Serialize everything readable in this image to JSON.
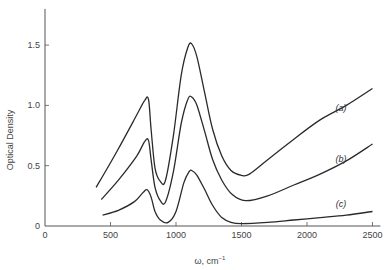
{
  "chart_data": {
    "type": "line",
    "title": "",
    "xlabel": "ω, cm⁻¹",
    "ylabel": "Optical Density",
    "xlim": [
      0,
      2500
    ],
    "ylim": [
      0,
      1.8
    ],
    "x_ticks": [
      0,
      500,
      1000,
      1500,
      2000,
      2500
    ],
    "y_ticks": [
      0,
      0.5,
      1.0,
      1.5
    ],
    "x_tick_labels": [
      "0",
      "500",
      "1000",
      "1500",
      "2000",
      "2500"
    ],
    "y_tick_labels": [
      "0",
      "0.5",
      "1.0",
      "1.5"
    ],
    "grid": false,
    "legend": "inline labels",
    "series": [
      {
        "name": "(a)",
        "label_pos": [
          2260,
          0.95
        ],
        "points": [
          [
            390,
            0.32
          ],
          [
            550,
            0.62
          ],
          [
            700,
            0.92
          ],
          [
            760,
            1.04
          ],
          [
            790,
            1.05
          ],
          [
            810,
            0.8
          ],
          [
            840,
            0.48
          ],
          [
            880,
            0.37
          ],
          [
            920,
            0.38
          ],
          [
            980,
            0.75
          ],
          [
            1040,
            1.25
          ],
          [
            1090,
            1.48
          ],
          [
            1120,
            1.51
          ],
          [
            1160,
            1.4
          ],
          [
            1220,
            1.1
          ],
          [
            1280,
            0.8
          ],
          [
            1350,
            0.58
          ],
          [
            1420,
            0.46
          ],
          [
            1500,
            0.42
          ],
          [
            1560,
            0.43
          ],
          [
            1700,
            0.55
          ],
          [
            1900,
            0.72
          ],
          [
            2100,
            0.88
          ],
          [
            2300,
            1.0
          ],
          [
            2500,
            1.14
          ]
        ]
      },
      {
        "name": "(b)",
        "label_pos": [
          2260,
          0.53
        ],
        "points": [
          [
            430,
            0.22
          ],
          [
            560,
            0.38
          ],
          [
            700,
            0.58
          ],
          [
            760,
            0.7
          ],
          [
            790,
            0.71
          ],
          [
            810,
            0.55
          ],
          [
            840,
            0.32
          ],
          [
            880,
            0.21
          ],
          [
            920,
            0.2
          ],
          [
            980,
            0.45
          ],
          [
            1040,
            0.85
          ],
          [
            1090,
            1.05
          ],
          [
            1120,
            1.07
          ],
          [
            1160,
            1.0
          ],
          [
            1220,
            0.78
          ],
          [
            1280,
            0.55
          ],
          [
            1350,
            0.38
          ],
          [
            1430,
            0.26
          ],
          [
            1530,
            0.21
          ],
          [
            1700,
            0.25
          ],
          [
            1900,
            0.34
          ],
          [
            2100,
            0.43
          ],
          [
            2300,
            0.54
          ],
          [
            2500,
            0.68
          ]
        ]
      },
      {
        "name": "(c)",
        "label_pos": [
          2260,
          0.16
        ],
        "points": [
          [
            440,
            0.09
          ],
          [
            560,
            0.13
          ],
          [
            680,
            0.2
          ],
          [
            750,
            0.28
          ],
          [
            780,
            0.3
          ],
          [
            810,
            0.24
          ],
          [
            840,
            0.12
          ],
          [
            880,
            0.05
          ],
          [
            940,
            0.03
          ],
          [
            1000,
            0.12
          ],
          [
            1060,
            0.36
          ],
          [
            1100,
            0.45
          ],
          [
            1120,
            0.46
          ],
          [
            1160,
            0.42
          ],
          [
            1220,
            0.3
          ],
          [
            1280,
            0.17
          ],
          [
            1350,
            0.07
          ],
          [
            1420,
            0.03
          ],
          [
            1500,
            0.02
          ],
          [
            1700,
            0.03
          ],
          [
            1900,
            0.05
          ],
          [
            2100,
            0.07
          ],
          [
            2300,
            0.09
          ],
          [
            2500,
            0.12
          ]
        ]
      }
    ]
  },
  "axes": {
    "x_label_text": "ω, cm",
    "x_label_sup": "−1",
    "y_label_text": "Optical Density"
  },
  "colors": {
    "axis": "#555555",
    "curve": "#2a2a2a",
    "background": "#ffffff"
  }
}
